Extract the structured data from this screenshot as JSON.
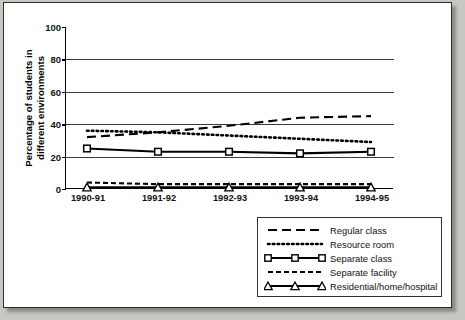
{
  "chart_data": {
    "type": "line",
    "title": "",
    "xlabel": "",
    "ylabel": "Percentage of students in different environments",
    "categories": [
      "1990-91",
      "1991-92",
      "1992-93",
      "1993-94",
      "1994-95"
    ],
    "ylim": [
      0,
      100
    ],
    "yticks": [
      0,
      20,
      40,
      60,
      80,
      100
    ],
    "grid": "horizontal",
    "legend_position": "bottom-right",
    "series": [
      {
        "name": "Regular class",
        "values": [
          32,
          35,
          39,
          44,
          45
        ],
        "style": "long-dash",
        "marker": "none"
      },
      {
        "name": "Resource room",
        "values": [
          36,
          35,
          33,
          31,
          29
        ],
        "style": "dotted",
        "marker": "none"
      },
      {
        "name": "Separate class",
        "values": [
          25,
          23,
          23,
          22,
          23
        ],
        "style": "solid",
        "marker": "square"
      },
      {
        "name": "Separate facility",
        "values": [
          4,
          3,
          3,
          3,
          3
        ],
        "style": "short-dash",
        "marker": "none"
      },
      {
        "name": "Residential/home/hospital",
        "values": [
          1,
          1,
          1,
          1,
          1
        ],
        "style": "solid",
        "marker": "triangle"
      }
    ]
  },
  "axis": {
    "y_tick_labels": [
      "0",
      "20",
      "40",
      "60",
      "80",
      "100"
    ],
    "y_title_line1": "Percentage of students in",
    "y_title_line2": "different environments",
    "x_tick_labels": [
      "1990-91",
      "1991-92",
      "1992-93",
      "1993-94",
      "1994-95"
    ]
  },
  "legend": {
    "items": [
      {
        "label": "Regular class"
      },
      {
        "label": "Resource room"
      },
      {
        "label": "Separate class"
      },
      {
        "label": "Separate facility"
      },
      {
        "label": "Residential/home/hospital"
      }
    ]
  },
  "colors": {
    "ink": "#000000",
    "grid": "#3a3a3a",
    "paper": "#ffffff",
    "backdrop": "#c8c8c2"
  }
}
